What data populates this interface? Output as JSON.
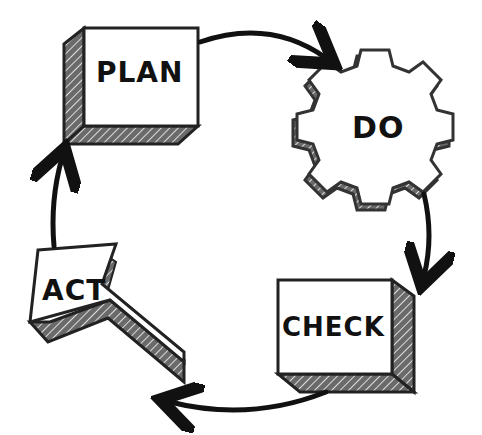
{
  "diagram": {
    "stages": [
      {
        "id": "plan",
        "label": "PLAN",
        "shape": "3d-box"
      },
      {
        "id": "do",
        "label": "DO",
        "shape": "gear"
      },
      {
        "id": "check",
        "label": "CHECK",
        "shape": "3d-box"
      },
      {
        "id": "act",
        "label": "ACT",
        "shape": "3d-arrow"
      }
    ],
    "flow": [
      {
        "from": "PLAN",
        "to": "DO"
      },
      {
        "from": "DO",
        "to": "CHECK"
      },
      {
        "from": "CHECK",
        "to": "ACT"
      },
      {
        "from": "ACT",
        "to": "PLAN"
      }
    ],
    "colors": {
      "ink": "#111111",
      "shade": "#555555",
      "background": "#ffffff"
    }
  }
}
